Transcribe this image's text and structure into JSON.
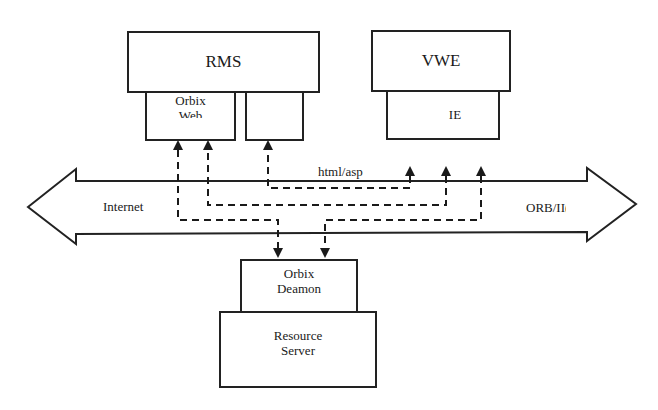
{
  "diagram": {
    "top_left_component": {
      "title": "RMS",
      "sub_boxes": [
        {
          "label_line1": "Orbix",
          "label_line2": "Web"
        },
        {
          "label_line1": ""
        }
      ]
    },
    "top_right_component": {
      "title": "VWE",
      "sub_boxes": [
        {
          "label_line1": "IE"
        }
      ]
    },
    "bus": {
      "left_label": "Internet",
      "right_label": "ORB/II(",
      "protocol_label": "html/asp"
    },
    "bottom_component": {
      "daemon": {
        "label_line1": "Orbix",
        "label_line2": "Deamon"
      },
      "server": {
        "label_line1": "Resource",
        "label_line2": "Server"
      }
    },
    "connections": [
      {
        "from": "IE",
        "to": "RMS-right-subbox",
        "style": "dashed",
        "via": "html/asp"
      },
      {
        "from": "IE",
        "to": "Orbix Web",
        "style": "dashed"
      },
      {
        "from": "Orbix Web",
        "to": "Orbix Deamon",
        "style": "dashed"
      },
      {
        "from": "IE",
        "to": "Orbix Deamon",
        "style": "dashed"
      }
    ]
  }
}
